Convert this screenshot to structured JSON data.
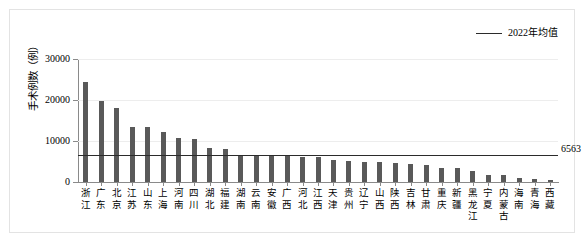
{
  "legend": {
    "series_label": "2022年均值",
    "line_color": "#2b2b2b"
  },
  "axis": {
    "y_title": "手术例数（例）",
    "y_ticks": [
      "0",
      "10000",
      "20000",
      "30000"
    ]
  },
  "annotation": {
    "mean_value_label": "6563"
  },
  "colors": {
    "bar": "#595959",
    "mean_line": "#2b2b2b",
    "gridline": "#ededed",
    "axis": "#8a8a8a",
    "card_border": "#e3e3e3"
  },
  "chart_data": {
    "type": "bar",
    "title": "",
    "xlabel": "",
    "ylabel": "手术例数（例）",
    "ylim": [
      0,
      30000
    ],
    "y_ticks": [
      0,
      10000,
      20000,
      30000
    ],
    "grid": true,
    "legend_position": "top-right",
    "categories": [
      "浙江",
      "广东",
      "北京",
      "江苏",
      "山东",
      "上海",
      "河南",
      "四川",
      "湖北",
      "福建",
      "湖南",
      "云南",
      "安徽",
      "广西",
      "河北",
      "江西",
      "天津",
      "贵州",
      "辽宁",
      "山西",
      "陕西",
      "吉林",
      "甘肃",
      "重庆",
      "新疆",
      "黑龙江",
      "宁夏",
      "内蒙古",
      "海南",
      "青海",
      "西藏"
    ],
    "values": [
      24300,
      19800,
      18100,
      13400,
      13300,
      12300,
      10800,
      10500,
      8300,
      8000,
      6400,
      6400,
      6300,
      6300,
      6200,
      6000,
      5400,
      5100,
      4900,
      4800,
      4700,
      4300,
      4200,
      3500,
      3400,
      2700,
      1800,
      1700,
      1100,
      700,
      400
    ],
    "series": [
      {
        "name": "2022年均值",
        "type": "hline",
        "value": 6563,
        "label": "6563"
      }
    ]
  }
}
